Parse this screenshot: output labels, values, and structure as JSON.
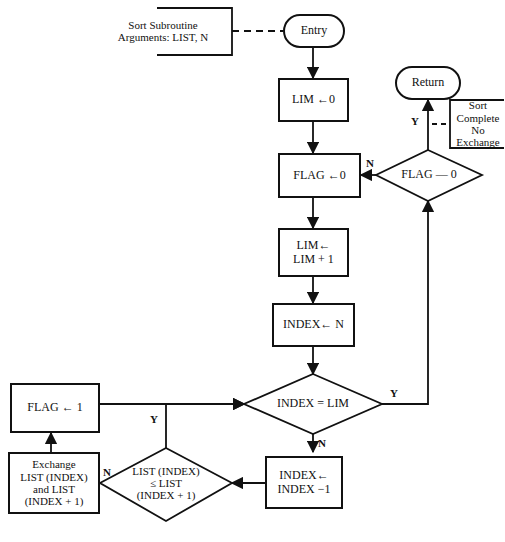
{
  "diagram": {
    "stroke_color": "#111111",
    "background_color": "#ffffff",
    "nodes": {
      "annotation_args": {
        "text": "Sort Subroutine\nArguments: LIST, N",
        "shape": "annotation-bracket"
      },
      "entry": {
        "text": "Entry",
        "shape": "terminal"
      },
      "lim_init": {
        "text": "LIM ←0",
        "shape": "process"
      },
      "flag_init": {
        "text": "FLAG ←0",
        "shape": "process"
      },
      "lim_inc": {
        "text": "LIM←\nLIM + 1",
        "shape": "process"
      },
      "index_init": {
        "text": "INDEX← N",
        "shape": "process"
      },
      "index_eq_lim": {
        "text": "INDEX = LIM",
        "shape": "decision"
      },
      "flag_eq_0": {
        "text": "FLAG — 0",
        "shape": "decision"
      },
      "return": {
        "text": "Return",
        "shape": "terminal"
      },
      "annotation_complete": {
        "text": "Sort\nComplete\nNo Exchange",
        "shape": "annotation-bracket"
      },
      "flag_set": {
        "text": "FLAG ← 1",
        "shape": "process"
      },
      "exchange": {
        "text": "Exchange\nLIST (INDEX)\nand LIST\n(INDEX + 1)",
        "shape": "process"
      },
      "compare": {
        "text": "LIST (INDEX)\n≤ LIST\n(INDEX + 1)",
        "shape": "decision"
      },
      "index_dec": {
        "text": "INDEX←\nINDEX −1",
        "shape": "process"
      }
    },
    "edge_labels": {
      "flag_eq_0_no": "N",
      "flag_eq_0_yes": "Y",
      "index_eq_lim_yes": "Y",
      "index_eq_lim_no": "N",
      "compare_yes": "Y",
      "compare_no": "N"
    }
  }
}
